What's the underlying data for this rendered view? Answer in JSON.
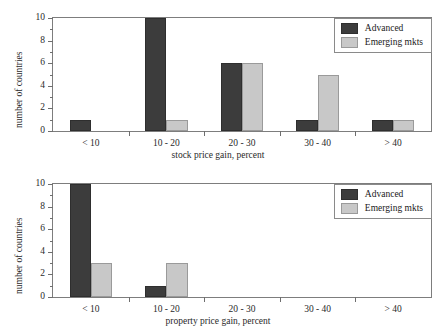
{
  "chart_data": [
    {
      "type": "bar",
      "id": "stock-price-gain",
      "title": "",
      "xlabel": "stock price gain, percent",
      "ylabel": "number of countries",
      "categories": [
        "< 10",
        "10 - 20",
        "20 - 30",
        "30 - 40",
        "> 40"
      ],
      "series": [
        {
          "name": "Advanced",
          "color": "#3c3c3c",
          "values": [
            1,
            10,
            6,
            1,
            1
          ]
        },
        {
          "name": "Emerging mkts",
          "color": "#c8c8c8",
          "values": [
            0,
            1,
            6,
            5,
            1
          ]
        }
      ],
      "ylim": [
        0,
        10
      ],
      "yticks": [
        0,
        2,
        4,
        6,
        8,
        10
      ],
      "ytick_labels": [
        "0",
        "2",
        "4",
        "6",
        "8",
        "10"
      ],
      "yminor_step": 1,
      "grid": false,
      "legend_position": "top-right"
    },
    {
      "type": "bar",
      "id": "property-price-gain",
      "title": "",
      "xlabel": "property price gain, percent",
      "ylabel": "number of countries",
      "categories": [
        "< 10",
        "10 - 20",
        "20 - 30",
        "30 - 40",
        "> 40"
      ],
      "series": [
        {
          "name": "Advanced",
          "color": "#3c3c3c",
          "values": [
            10,
            1,
            0,
            0,
            0
          ]
        },
        {
          "name": "Emerging mkts",
          "color": "#c8c8c8",
          "values": [
            3,
            3,
            0,
            0,
            0
          ]
        }
      ],
      "ylim": [
        0,
        10
      ],
      "yticks": [
        0,
        2,
        4,
        6,
        8,
        10
      ],
      "ytick_labels": [
        "0",
        "2",
        "4",
        "6",
        "8",
        "10"
      ],
      "yminor_step": 1,
      "grid": false,
      "legend_position": "top-right"
    }
  ],
  "panels": {
    "stock": {
      "ylabel": "number of countries",
      "xlabel": "stock price gain, percent",
      "ytick_labels": [
        "10",
        "8",
        "6",
        "4",
        "2",
        "0"
      ],
      "categories": [
        "< 10",
        "10 - 20",
        "20 - 30",
        "30 - 40",
        "> 40"
      ],
      "legend": {
        "advanced": "Advanced",
        "emerging": "Emerging mkts"
      }
    },
    "property": {
      "ylabel": "number of countries",
      "xlabel": "property price gain, percent",
      "ytick_labels": [
        "10",
        "8",
        "6",
        "4",
        "2",
        "0"
      ],
      "categories": [
        "< 10",
        "10 - 20",
        "20 - 30",
        "30 - 40",
        "> 40"
      ],
      "legend": {
        "advanced": "Advanced",
        "emerging": "Emerging mkts"
      }
    }
  },
  "colors": {
    "advanced": "#3c3c3c",
    "emerging": "#c8c8c8",
    "axis": "#6e6e6e",
    "background": "#ffffff"
  }
}
